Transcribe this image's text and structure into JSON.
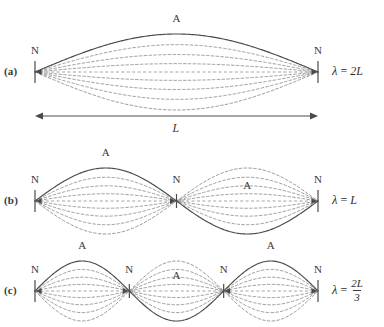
{
  "figure": {
    "background": "#ffffff",
    "stroke_solid": "#4a4a4a",
    "stroke_dashed": "#8d8d8d",
    "text_color": "#3a3a3a",
    "string_left_x": 35,
    "string_right_x": 318
  },
  "panels": [
    {
      "id": "a",
      "label": "(a)",
      "axis_y": 72,
      "loops": 1,
      "amplitude": 38,
      "first_loop_up": true,
      "node_labels": [
        "N",
        "N"
      ],
      "antinode_labels": [
        "A"
      ],
      "equation": {
        "symbol": "λ",
        "equals": "=",
        "value": "2L",
        "is_fraction": false,
        "numerator": "",
        "denominator": ""
      }
    },
    {
      "id": "b",
      "label": "(b)",
      "axis_y": 201,
      "loops": 2,
      "amplitude": 33,
      "first_loop_up": true,
      "node_labels": [
        "N",
        "N",
        "N"
      ],
      "antinode_labels": [
        "A",
        "A"
      ],
      "equation": {
        "symbol": "λ",
        "equals": "=",
        "value": "L",
        "is_fraction": false,
        "numerator": "",
        "denominator": ""
      }
    },
    {
      "id": "c",
      "label": "(c)",
      "axis_y": 291,
      "loops": 3,
      "amplitude": 30,
      "first_loop_up": true,
      "node_labels": [
        "N",
        "N",
        "N",
        "N"
      ],
      "antinode_labels": [
        "A",
        "A",
        "A"
      ],
      "equation": {
        "symbol": "λ",
        "equals": "=",
        "value": "",
        "is_fraction": true,
        "numerator": "2L",
        "denominator": "3"
      }
    }
  ],
  "dimension": {
    "label": "L",
    "arrow_y": 116,
    "left_x": 35,
    "right_x": 318
  },
  "chart_data": {
    "type": "line",
    "xlabel": "position along string",
    "ylabel": "displacement",
    "grid": false,
    "legend": "none",
    "xlim": [
      0,
      1
    ],
    "series": [
      {
        "name": "fundamental (n=1)",
        "harmonic": 1,
        "nodes": 2,
        "antinodes": 1,
        "wavelength": "2L",
        "amplitude_fractions": [
          1.0,
          0.72,
          0.46,
          0.22
        ]
      },
      {
        "name": "second harmonic (n=2)",
        "harmonic": 2,
        "nodes": 3,
        "antinodes": 2,
        "wavelength": "L",
        "amplitude_fractions": [
          1.0,
          0.72,
          0.46,
          0.22
        ]
      },
      {
        "name": "third harmonic (n=3)",
        "harmonic": 3,
        "nodes": 4,
        "antinodes": 3,
        "wavelength": "2L/3",
        "amplitude_fractions": [
          1.0,
          0.72,
          0.46,
          0.22
        ]
      }
    ]
  },
  "caption": {
    "text": ""
  }
}
